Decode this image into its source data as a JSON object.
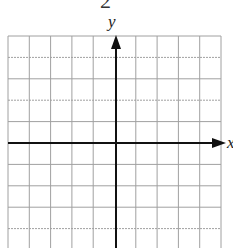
{
  "problem_number": "2",
  "axes": {
    "x_label": "x",
    "y_label": "y"
  },
  "grid": {
    "columns": 10,
    "rows_visible": 10,
    "line_color": "#9a9a9a",
    "axis_color": "#111111"
  }
}
